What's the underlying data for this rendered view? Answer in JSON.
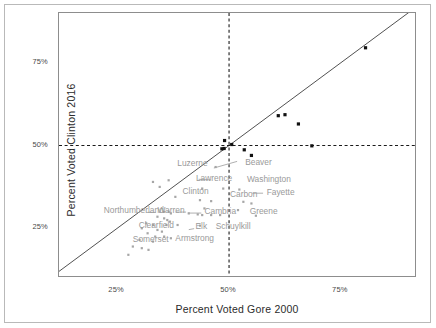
{
  "chart_data": {
    "type": "scatter",
    "title": "",
    "xlabel": "Percent Voted Gore 2000",
    "ylabel": "Percent Voted Clinton 2016",
    "xlim": [
      12,
      92
    ],
    "ylim": [
      10,
      90
    ],
    "xticks": [
      25,
      50,
      75
    ],
    "xtick_labels": [
      "25%",
      "50%",
      "75%"
    ],
    "yticks": [
      25,
      50,
      75
    ],
    "ytick_labels": [
      "25%",
      "50%",
      "75%"
    ],
    "grid": false,
    "legend": null,
    "reference_lines": [
      {
        "name": "identity-line",
        "type": "diagonal",
        "slope": 1,
        "intercept": 0,
        "style": "solid",
        "color": "#3d3d3d"
      },
      {
        "name": "vertical-50-line",
        "type": "vertical",
        "value": 50,
        "style": "dashed",
        "color": "#1a1a1a"
      },
      {
        "name": "horizontal-50-line",
        "type": "horizontal",
        "value": 50,
        "style": "dashed",
        "color": "#1a1a1a"
      }
    ],
    "series": [
      {
        "name": "Counties Clinton won (dark)",
        "color": "#111111",
        "marker": "square",
        "size": 3.2,
        "points": [
          {
            "x": 80.5,
            "y": 79.5
          },
          {
            "x": 61.0,
            "y": 59.0
          },
          {
            "x": 62.5,
            "y": 59.3
          },
          {
            "x": 65.5,
            "y": 56.5
          },
          {
            "x": 49.0,
            "y": 51.5
          },
          {
            "x": 50.6,
            "y": 50.3
          },
          {
            "x": 48.4,
            "y": 49.0
          },
          {
            "x": 48.9,
            "y": 49.1
          },
          {
            "x": 53.4,
            "y": 48.7
          },
          {
            "x": 68.5,
            "y": 49.9
          },
          {
            "x": 55.0,
            "y": 47.0
          }
        ]
      },
      {
        "name": "Counties Trump won (light)",
        "color": "#a6a6a6",
        "marker": "square",
        "size": 2.2,
        "points": [
          {
            "x": 47.0,
            "y": 43.5
          },
          {
            "x": 33.0,
            "y": 39.0
          },
          {
            "x": 36.5,
            "y": 39.5
          },
          {
            "x": 34.5,
            "y": 37.5
          },
          {
            "x": 44.0,
            "y": 37.0
          },
          {
            "x": 48.7,
            "y": 37.0
          },
          {
            "x": 52.3,
            "y": 36.7
          },
          {
            "x": 38.0,
            "y": 34.5
          },
          {
            "x": 43.5,
            "y": 33.5
          },
          {
            "x": 46.0,
            "y": 33.2
          },
          {
            "x": 53.2,
            "y": 33.0
          },
          {
            "x": 55.0,
            "y": 32.5
          },
          {
            "x": 44.5,
            "y": 31.0
          },
          {
            "x": 52.0,
            "y": 30.5
          },
          {
            "x": 35.5,
            "y": 30.0
          },
          {
            "x": 36.5,
            "y": 30.0
          },
          {
            "x": 37.0,
            "y": 29.5
          },
          {
            "x": 41.0,
            "y": 29.5
          },
          {
            "x": 43.0,
            "y": 29.2
          },
          {
            "x": 44.0,
            "y": 29.0
          },
          {
            "x": 46.0,
            "y": 29.0
          },
          {
            "x": 48.0,
            "y": 29.0
          },
          {
            "x": 56.0,
            "y": 28.8
          },
          {
            "x": 34.0,
            "y": 28.5
          },
          {
            "x": 35.5,
            "y": 28.0
          },
          {
            "x": 36.2,
            "y": 27.5
          },
          {
            "x": 36.8,
            "y": 27.0
          },
          {
            "x": 31.5,
            "y": 26.5
          },
          {
            "x": 33.0,
            "y": 26.0
          },
          {
            "x": 36.0,
            "y": 26.0
          },
          {
            "x": 38.5,
            "y": 26.0
          },
          {
            "x": 43.5,
            "y": 25.8
          },
          {
            "x": 30.5,
            "y": 25.0
          },
          {
            "x": 34.0,
            "y": 24.5
          },
          {
            "x": 35.0,
            "y": 24.0
          },
          {
            "x": 31.8,
            "y": 23.5
          },
          {
            "x": 33.5,
            "y": 22.5
          },
          {
            "x": 35.5,
            "y": 22.5
          },
          {
            "x": 37.0,
            "y": 22.0
          },
          {
            "x": 30.0,
            "y": 21.5
          },
          {
            "x": 33.0,
            "y": 21.0
          },
          {
            "x": 28.5,
            "y": 19.5
          },
          {
            "x": 30.5,
            "y": 19.0
          },
          {
            "x": 32.0,
            "y": 18.5
          },
          {
            "x": 27.5,
            "y": 17.0
          }
        ]
      }
    ],
    "annotations": [
      {
        "label": "Luzerne",
        "x": 45.2,
        "y": 43.8,
        "anchor": "end"
      },
      {
        "label": "Beaver",
        "x": 53.6,
        "y": 44.2,
        "anchor": "start"
      },
      {
        "label": "Lawrence",
        "x": 42.6,
        "y": 39.2,
        "anchor": "start"
      },
      {
        "label": "Washington",
        "x": 54.0,
        "y": 39.0,
        "anchor": "start"
      },
      {
        "label": "Clinton",
        "x": 39.6,
        "y": 35.5,
        "anchor": "start"
      },
      {
        "label": "Carbon",
        "x": 50.2,
        "y": 34.6,
        "anchor": "start"
      },
      {
        "label": "Fayette",
        "x": 58.4,
        "y": 35.2,
        "anchor": "start"
      },
      {
        "label": "Northumberland",
        "x": 22.0,
        "y": 29.5,
        "anchor": "start"
      },
      {
        "label": "Warren",
        "x": 34.0,
        "y": 29.6,
        "anchor": "start"
      },
      {
        "label": "Cambria",
        "x": 44.5,
        "y": 29.4,
        "anchor": "start"
      },
      {
        "label": "Greene",
        "x": 54.6,
        "y": 29.3,
        "anchor": "start"
      },
      {
        "label": "Clearfield",
        "x": 29.8,
        "y": 25.2,
        "anchor": "start"
      },
      {
        "label": "Elk",
        "x": 42.5,
        "y": 24.9,
        "anchor": "start"
      },
      {
        "label": "Schuylkill",
        "x": 47.0,
        "y": 24.8,
        "anchor": "start"
      },
      {
        "label": "Somerset",
        "x": 28.5,
        "y": 21.0,
        "anchor": "start"
      },
      {
        "label": "Armstrong",
        "x": 38.0,
        "y": 21.2,
        "anchor": "start"
      }
    ],
    "leader_lines": [
      {
        "from": {
          "x": 46.6,
          "y": 43.2
        },
        "to": {
          "x": 51.8,
          "y": 45.2
        }
      },
      {
        "from": {
          "x": 46.0,
          "y": 39.6
        },
        "to": {
          "x": 43.2,
          "y": 39.8
        }
      },
      {
        "from": {
          "x": 55.2,
          "y": 35.6
        },
        "to": {
          "x": 57.6,
          "y": 35.6
        }
      },
      {
        "from": {
          "x": 38.0,
          "y": 29.9
        },
        "to": {
          "x": 40.4,
          "y": 29.9
        }
      },
      {
        "from": {
          "x": 40.8,
          "y": 29.6
        },
        "to": {
          "x": 43.8,
          "y": 29.6
        }
      },
      {
        "from": {
          "x": 31.5,
          "y": 29.8
        },
        "to": {
          "x": 33.6,
          "y": 29.8
        }
      },
      {
        "from": {
          "x": 41.0,
          "y": 24.6
        },
        "to": {
          "x": 42.2,
          "y": 24.9
        }
      }
    ]
  },
  "axes": {
    "x_title": "Percent Voted Gore 2000",
    "y_title": "Percent Voted Clinton 2016",
    "x_ticks": [
      {
        "label": "25%",
        "value": 25
      },
      {
        "label": "50%",
        "value": 50
      },
      {
        "label": "75%",
        "value": 75
      }
    ],
    "y_ticks": [
      {
        "label": "25%",
        "value": 25
      },
      {
        "label": "50%",
        "value": 50
      },
      {
        "label": "75%",
        "value": 75
      }
    ]
  },
  "colors": {
    "dark_marker": "#111111",
    "light_marker": "#a6a6a6",
    "label_text": "#9a9a9a",
    "axis_text": "#4a4a4a",
    "panel_border": "#8d8d8d",
    "frame_border": "#b9b9b9",
    "identity_line": "#3d3d3d",
    "dashed_line": "#1a1a1a"
  }
}
